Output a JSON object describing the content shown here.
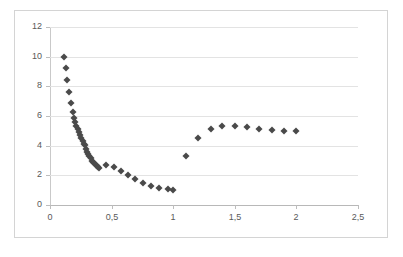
{
  "chart_data": {
    "type": "scatter",
    "title": "",
    "subtitle": "",
    "xlabel": "",
    "ylabel": "",
    "xlim": [
      0,
      2.5
    ],
    "ylim": [
      0,
      12
    ],
    "grid": true,
    "legend": false,
    "legend_position": "none",
    "marker": "diamond",
    "marker_color": "#4a4a4a",
    "decimal_separator": ",",
    "x_ticks": [
      0,
      0.5,
      1,
      1.5,
      2,
      2.5
    ],
    "x_tick_labels": [
      "0",
      "0,5",
      "1",
      "1,5",
      "2",
      "2,5"
    ],
    "y_ticks": [
      0,
      2,
      4,
      6,
      8,
      10,
      12
    ],
    "y_tick_labels": [
      "0",
      "2",
      "4",
      "6",
      "8",
      "10",
      "12"
    ],
    "series": [
      {
        "name": "series-1",
        "points": [
          [
            0.11,
            10.0
          ],
          [
            0.13,
            9.25
          ],
          [
            0.14,
            8.4
          ],
          [
            0.155,
            7.6
          ],
          [
            0.17,
            6.85
          ],
          [
            0.185,
            6.25
          ],
          [
            0.195,
            5.85
          ],
          [
            0.205,
            5.6
          ],
          [
            0.215,
            5.35
          ],
          [
            0.225,
            5.1
          ],
          [
            0.235,
            4.9
          ],
          [
            0.245,
            4.7
          ],
          [
            0.255,
            4.5
          ],
          [
            0.265,
            4.3
          ],
          [
            0.275,
            4.1
          ],
          [
            0.285,
            4.05
          ],
          [
            0.295,
            3.8
          ],
          [
            0.3,
            3.6
          ],
          [
            0.31,
            3.45
          ],
          [
            0.32,
            3.3
          ],
          [
            0.33,
            3.15
          ],
          [
            0.34,
            3.0
          ],
          [
            0.35,
            2.9
          ],
          [
            0.36,
            2.8
          ],
          [
            0.37,
            2.72
          ],
          [
            0.38,
            2.62
          ],
          [
            0.39,
            2.55
          ],
          [
            0.4,
            2.5
          ],
          [
            0.455,
            2.68
          ],
          [
            0.52,
            2.55
          ],
          [
            0.575,
            2.3
          ],
          [
            0.63,
            2.0
          ],
          [
            0.69,
            1.78
          ],
          [
            0.755,
            1.45
          ],
          [
            0.82,
            1.25
          ],
          [
            0.885,
            1.15
          ],
          [
            0.955,
            1.05
          ],
          [
            1.0,
            1.02
          ],
          [
            1.105,
            3.3
          ],
          [
            1.205,
            4.5
          ],
          [
            1.305,
            5.1
          ],
          [
            1.4,
            5.3
          ],
          [
            1.5,
            5.3
          ],
          [
            1.6,
            5.25
          ],
          [
            1.7,
            5.15
          ],
          [
            1.8,
            5.05
          ],
          [
            1.9,
            5.0
          ],
          [
            2.0,
            5.0
          ]
        ]
      }
    ]
  }
}
